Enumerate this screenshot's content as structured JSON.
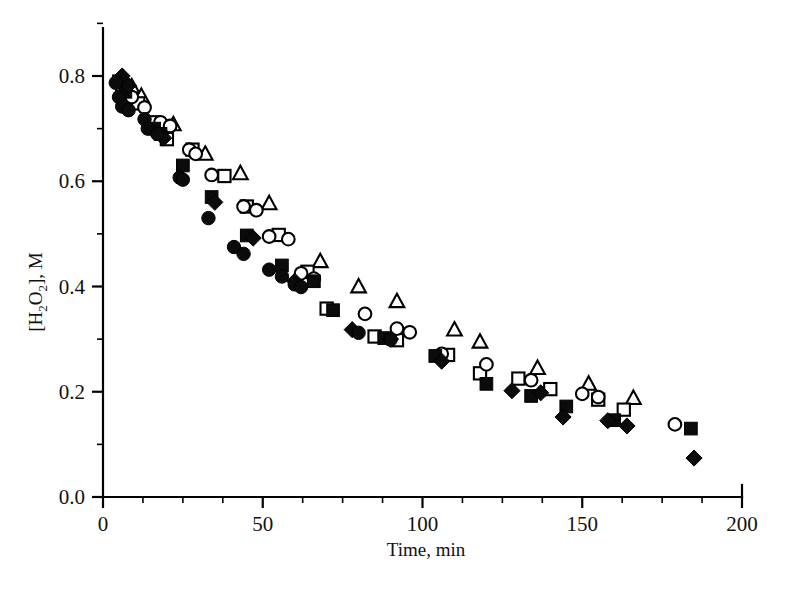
{
  "figure": {
    "background": "#ffffff",
    "ink_color": "#000000",
    "width": 786,
    "height": 592
  },
  "chart_data": {
    "type": "scatter",
    "title": "",
    "subtitle": "",
    "xlabel": "Time, min",
    "ylabel": "[H2O2], M",
    "ylabel_display": "[H₂O₂], M",
    "xlim": [
      0,
      200
    ],
    "ylim": [
      0.0,
      0.8
    ],
    "x_ticks": [
      0,
      50,
      100,
      150,
      200
    ],
    "x_tick_labels": [
      "0",
      "50",
      "100",
      "150",
      "200"
    ],
    "x_minor_step": 12.5,
    "y_ticks": [
      0.0,
      0.2,
      0.4,
      0.6,
      0.8
    ],
    "y_tick_labels": [
      "0.0",
      "0.2",
      "0.4",
      "0.6",
      "0.8"
    ],
    "y_minor_step": 0.1,
    "grid": false,
    "legend": false,
    "legend_position": "none",
    "axis_style": "left-and-bottom-spines-with-outward-ticks",
    "series": [
      {
        "name": "Run 1",
        "marker": "filled-circle",
        "color": "#0b0b0b",
        "filled": true,
        "points": [
          [
            4,
            0.787
          ],
          [
            5,
            0.76
          ],
          [
            6,
            0.742
          ],
          [
            8,
            0.735
          ],
          [
            13,
            0.718
          ],
          [
            14,
            0.7
          ],
          [
            17,
            0.69
          ],
          [
            24,
            0.607
          ],
          [
            25,
            0.603
          ],
          [
            33,
            0.53
          ],
          [
            41,
            0.475
          ],
          [
            44,
            0.462
          ],
          [
            52,
            0.432
          ],
          [
            56,
            0.419
          ],
          [
            60,
            0.404
          ],
          [
            62,
            0.399
          ],
          [
            80,
            0.312
          ],
          [
            90,
            0.299
          ]
        ]
      },
      {
        "name": "Run 2",
        "marker": "open-circle",
        "color": "#0b0b0b",
        "filled": false,
        "points": [
          [
            6,
            0.775
          ],
          [
            9,
            0.76
          ],
          [
            13,
            0.74
          ],
          [
            18,
            0.712
          ],
          [
            21,
            0.705
          ],
          [
            27,
            0.66
          ],
          [
            29,
            0.652
          ],
          [
            34,
            0.612
          ],
          [
            44,
            0.552
          ],
          [
            48,
            0.545
          ],
          [
            52,
            0.495
          ],
          [
            58,
            0.49
          ],
          [
            62,
            0.425
          ],
          [
            66,
            0.415
          ],
          [
            82,
            0.348
          ],
          [
            92,
            0.32
          ],
          [
            96,
            0.313
          ],
          [
            106,
            0.272
          ],
          [
            120,
            0.252
          ],
          [
            134,
            0.222
          ],
          [
            150,
            0.196
          ],
          [
            155,
            0.19
          ],
          [
            179,
            0.138
          ]
        ]
      },
      {
        "name": "Run 3",
        "marker": "open-square",
        "color": "#0b0b0b",
        "filled": false,
        "points": [
          [
            7,
            0.76
          ],
          [
            11,
            0.748
          ],
          [
            16,
            0.712
          ],
          [
            19,
            0.7
          ],
          [
            20,
            0.68
          ],
          [
            28,
            0.66
          ],
          [
            38,
            0.61
          ],
          [
            45,
            0.552
          ],
          [
            55,
            0.498
          ],
          [
            64,
            0.428
          ],
          [
            70,
            0.358
          ],
          [
            85,
            0.305
          ],
          [
            92,
            0.298
          ],
          [
            108,
            0.27
          ],
          [
            118,
            0.235
          ],
          [
            130,
            0.225
          ],
          [
            140,
            0.205
          ],
          [
            155,
            0.185
          ],
          [
            163,
            0.166
          ]
        ]
      },
      {
        "name": "Run 4",
        "marker": "filled-square",
        "color": "#0b0b0b",
        "filled": true,
        "points": [
          [
            5,
            0.79
          ],
          [
            7,
            0.77
          ],
          [
            16,
            0.7
          ],
          [
            18,
            0.69
          ],
          [
            25,
            0.63
          ],
          [
            34,
            0.57
          ],
          [
            45,
            0.497
          ],
          [
            56,
            0.44
          ],
          [
            66,
            0.41
          ],
          [
            72,
            0.355
          ],
          [
            88,
            0.302
          ],
          [
            104,
            0.268
          ],
          [
            120,
            0.215
          ],
          [
            134,
            0.192
          ],
          [
            145,
            0.172
          ],
          [
            160,
            0.146
          ],
          [
            184,
            0.13
          ]
        ]
      },
      {
        "name": "Run 5",
        "marker": "filled-diamond",
        "color": "#0b0b0b",
        "filled": true,
        "points": [
          [
            6,
            0.8
          ],
          [
            8,
            0.782
          ],
          [
            19,
            0.682
          ],
          [
            35,
            0.56
          ],
          [
            47,
            0.492
          ],
          [
            60,
            0.41
          ],
          [
            78,
            0.318
          ],
          [
            90,
            0.3
          ],
          [
            106,
            0.258
          ],
          [
            128,
            0.202
          ],
          [
            137,
            0.198
          ],
          [
            144,
            0.152
          ],
          [
            158,
            0.145
          ],
          [
            164,
            0.135
          ],
          [
            185,
            0.074
          ]
        ]
      },
      {
        "name": "Run 6",
        "marker": "open-triangle",
        "color": "#0b0b0b",
        "filled": false,
        "points": [
          [
            9,
            0.78
          ],
          [
            12,
            0.762
          ],
          [
            22,
            0.708
          ],
          [
            32,
            0.652
          ],
          [
            43,
            0.615
          ],
          [
            52,
            0.558
          ],
          [
            68,
            0.448
          ],
          [
            80,
            0.4
          ],
          [
            92,
            0.372
          ],
          [
            110,
            0.318
          ],
          [
            118,
            0.295
          ],
          [
            136,
            0.245
          ],
          [
            152,
            0.215
          ],
          [
            166,
            0.188
          ]
        ]
      }
    ]
  }
}
